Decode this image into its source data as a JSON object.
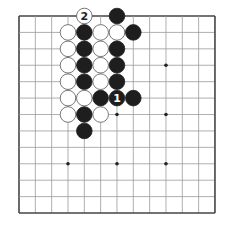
{
  "diagram": {
    "type": "go-board",
    "size": 13,
    "origin_px": {
      "x": 19,
      "y": 16
    },
    "step_px": {
      "x": 16.33,
      "y": 16.42
    },
    "stone_radius_px": 7.8,
    "colors": {
      "background": "#ffffff",
      "grid_line": "#9a9a9a",
      "border": "#444444",
      "black_stone": "#1e1e1e",
      "white_stone": "#ffffff",
      "white_stone_edge": "#555555",
      "hoshi": "#222222"
    },
    "hoshi": [
      [
        3,
        9
      ],
      [
        6,
        9
      ],
      [
        9,
        9
      ],
      [
        6,
        6
      ],
      [
        9,
        6
      ],
      [
        9,
        3
      ]
    ],
    "stones": [
      {
        "col": 4,
        "row": 0,
        "color": "white",
        "label": "2"
      },
      {
        "col": 6,
        "row": 0,
        "color": "black",
        "label": ""
      },
      {
        "col": 3,
        "row": 1,
        "color": "white",
        "label": ""
      },
      {
        "col": 4,
        "row": 1,
        "color": "black",
        "label": ""
      },
      {
        "col": 5,
        "row": 1,
        "color": "white",
        "label": ""
      },
      {
        "col": 6,
        "row": 1,
        "color": "white",
        "label": ""
      },
      {
        "col": 7,
        "row": 1,
        "color": "black",
        "label": ""
      },
      {
        "col": 3,
        "row": 2,
        "color": "white",
        "label": ""
      },
      {
        "col": 4,
        "row": 2,
        "color": "black",
        "label": ""
      },
      {
        "col": 5,
        "row": 2,
        "color": "white",
        "label": ""
      },
      {
        "col": 6,
        "row": 2,
        "color": "black",
        "label": ""
      },
      {
        "col": 3,
        "row": 3,
        "color": "white",
        "label": ""
      },
      {
        "col": 4,
        "row": 3,
        "color": "black",
        "label": ""
      },
      {
        "col": 5,
        "row": 3,
        "color": "white",
        "label": ""
      },
      {
        "col": 6,
        "row": 3,
        "color": "black",
        "label": ""
      },
      {
        "col": 3,
        "row": 4,
        "color": "white",
        "label": ""
      },
      {
        "col": 4,
        "row": 4,
        "color": "black",
        "label": ""
      },
      {
        "col": 5,
        "row": 4,
        "color": "white",
        "label": ""
      },
      {
        "col": 6,
        "row": 4,
        "color": "black",
        "label": ""
      },
      {
        "col": 3,
        "row": 5,
        "color": "white",
        "label": ""
      },
      {
        "col": 4,
        "row": 5,
        "color": "white",
        "label": ""
      },
      {
        "col": 5,
        "row": 5,
        "color": "black",
        "label": ""
      },
      {
        "col": 6,
        "row": 5,
        "color": "black",
        "label": "1"
      },
      {
        "col": 7,
        "row": 5,
        "color": "black",
        "label": ""
      },
      {
        "col": 3,
        "row": 6,
        "color": "white",
        "label": ""
      },
      {
        "col": 4,
        "row": 6,
        "color": "black",
        "label": ""
      },
      {
        "col": 5,
        "row": 6,
        "color": "white",
        "label": ""
      },
      {
        "col": 4,
        "row": 7,
        "color": "black",
        "label": ""
      }
    ]
  }
}
